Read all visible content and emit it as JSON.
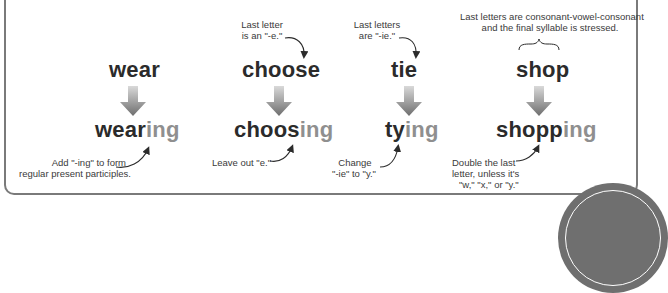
{
  "colors": {
    "word": "#2b2b2b",
    "suffix": "#8f8f8f",
    "arrow_top": "#d0d0d0",
    "arrow_bottom": "#6e6e6e",
    "border": "#7a7a7a",
    "note": "#3a3a3a"
  },
  "columns": [
    {
      "base": "wear",
      "result_stem": "wear",
      "result_suffix": "ing",
      "top_note": "",
      "bottom_note_line1": "Add \"-ing\" to form",
      "bottom_note_line2": "regular present participles."
    },
    {
      "base": "choose",
      "result_stem": "choos",
      "result_suffix": "ing",
      "top_note_line1": "Last letter",
      "top_note_line2": "is an \"-e.\"",
      "bottom_note_line1": "Leave out \"e.\""
    },
    {
      "base": "tie",
      "result_stem": "ty",
      "result_suffix": "ing",
      "top_note_line1": "Last letters",
      "top_note_line2": "are \"-ie.\"",
      "bottom_note_line1": "Change",
      "bottom_note_line2": "\"-ie\" to \"y.\""
    },
    {
      "base": "shop",
      "result_stem": "shopp",
      "result_suffix": "ing",
      "top_note_line1": "Last letters are consonant-vowel-consonant",
      "top_note_line2": "and the final syllable is stressed.",
      "bottom_note_line1": "Double the last",
      "bottom_note_line2": "letter, unless it's",
      "bottom_note_line3": "\"w,\" \"x,\" or \"y.\""
    }
  ],
  "icons": {
    "down_arrow": "down-arrow-icon",
    "curved_arrow": "curved-arrow-icon",
    "brace": "curly-brace-icon",
    "badge": "circle-badge"
  }
}
